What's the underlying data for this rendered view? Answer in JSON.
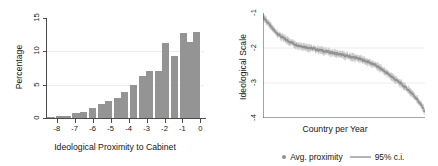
{
  "chart_data": [
    {
      "type": "bar",
      "panel": "left",
      "title": "",
      "xlabel": "Ideological Proximity to Cabinet",
      "ylabel": "Percentage",
      "xlim": [
        -8.6,
        0.2
      ],
      "ylim": [
        0,
        15
      ],
      "yticks": [
        0,
        5,
        10,
        15
      ],
      "ytick_labels": [
        "0",
        "5",
        "10",
        "15"
      ],
      "xticks": [
        -8,
        -7,
        -6,
        -5,
        -4,
        -3,
        -2,
        -1,
        0
      ],
      "xtick_labels": [
        "-8",
        "-7",
        "-6",
        "-5",
        "-4",
        "-3",
        "-2",
        "-1",
        "0"
      ],
      "grid": true,
      "bar_color": "#949494",
      "bin_width": 0.46,
      "categories": [
        "-8.3",
        "-7.8",
        "-7.4",
        "-6.9",
        "-6.5",
        "-6.0",
        "-5.5",
        "-5.1",
        "-4.6",
        "-4.2",
        "-3.7",
        "-3.2",
        "-2.8",
        "-2.3",
        "-1.9",
        "-1.4",
        "-0.9",
        "-0.5",
        "-0.2"
      ],
      "values": [
        0.15,
        0.3,
        0.35,
        0.8,
        0.9,
        1.5,
        2.1,
        2.6,
        3.0,
        3.9,
        4.9,
        6.3,
        7.1,
        7.0,
        11.3,
        9.3,
        12.7,
        11.4,
        12.9
      ]
    },
    {
      "type": "line",
      "panel": "right",
      "title": "",
      "xlabel": "Country per Year",
      "ylabel": "Ideological Scale",
      "xlim": [
        0,
        1
      ],
      "ylim": [
        -4,
        -1
      ],
      "yticks": [
        -1,
        -2,
        -3,
        -4
      ],
      "ytick_labels": [
        "-1",
        "-2",
        "-3",
        "-4"
      ],
      "xticks": [],
      "xtick_labels": [],
      "grid": true,
      "series": [
        {
          "name": "Avg. proximity",
          "color": "#8f8f8f",
          "marker": "dot",
          "x": [
            0.0,
            0.02,
            0.04,
            0.06,
            0.08,
            0.1,
            0.12,
            0.14,
            0.16,
            0.18,
            0.2,
            0.22,
            0.24,
            0.26,
            0.28,
            0.3,
            0.32,
            0.34,
            0.36,
            0.38,
            0.4,
            0.42,
            0.44,
            0.46,
            0.48,
            0.5,
            0.52,
            0.54,
            0.56,
            0.58,
            0.6,
            0.62,
            0.64,
            0.66,
            0.68,
            0.7,
            0.72,
            0.74,
            0.76,
            0.78,
            0.8,
            0.82,
            0.84,
            0.86,
            0.88,
            0.9,
            0.92,
            0.94,
            0.96,
            0.98,
            1.0
          ],
          "y": [
            -1.1,
            -1.22,
            -1.34,
            -1.45,
            -1.55,
            -1.63,
            -1.7,
            -1.76,
            -1.81,
            -1.85,
            -1.9,
            -1.93,
            -1.95,
            -1.97,
            -1.99,
            -2.01,
            -2.03,
            -2.05,
            -2.07,
            -2.09,
            -2.11,
            -2.13,
            -2.15,
            -2.17,
            -2.19,
            -2.21,
            -2.23,
            -2.25,
            -2.27,
            -2.29,
            -2.32,
            -2.35,
            -2.38,
            -2.42,
            -2.46,
            -2.51,
            -2.57,
            -2.63,
            -2.7,
            -2.77,
            -2.84,
            -2.91,
            -2.98,
            -3.05,
            -3.13,
            -3.21,
            -3.3,
            -3.4,
            -3.52,
            -3.66,
            -3.82
          ]
        }
      ],
      "ci": {
        "name": "95% c.i.",
        "color": "#c4c4c4",
        "half_width": 0.09
      },
      "legend": [
        {
          "label": "Avg. proximity",
          "marker": "dot",
          "color": "#8f8f8f"
        },
        {
          "label": "95% c.i.",
          "marker": "line",
          "color": "#b4b4b4"
        }
      ],
      "legend_position": "below"
    }
  ],
  "left_panel": {
    "ylabel": "Percentage",
    "xlabel": "Ideological Proximity to Cabinet"
  },
  "right_panel": {
    "ylabel": "Ideological Scale",
    "xlabel": "Country per Year",
    "legend_avg": "Avg. proximity",
    "legend_ci": "95% c.i."
  }
}
